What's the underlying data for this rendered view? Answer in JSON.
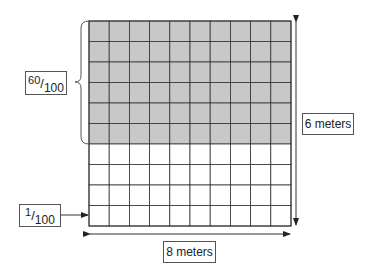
{
  "diagram": {
    "grid": {
      "columns": 10,
      "rows": 10,
      "shaded_rows": 6,
      "shade_color": "#c8c8c8",
      "line_color": "#333333"
    },
    "shaded_fraction_label": {
      "numerator": "60",
      "denominator": "100"
    },
    "unit_fraction_label": {
      "numerator": "1",
      "denominator": "100"
    },
    "height_label": "6 meters",
    "width_label": "8 meters"
  }
}
